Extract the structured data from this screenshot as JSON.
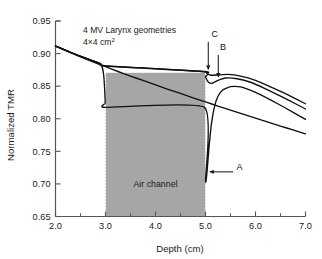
{
  "chart_data": {
    "type": "line",
    "title": "",
    "xlabel": "Depth (cm)",
    "ylabel": "Normalized TMR",
    "xlim": [
      2.0,
      7.0
    ],
    "ylim": [
      0.65,
      0.95
    ],
    "xticks": [
      "2.0",
      "3.0",
      "4.0",
      "5.0",
      "6.0",
      "7.0"
    ],
    "xtick_values": [
      2.0,
      3.0,
      4.0,
      5.0,
      6.0,
      7.0
    ],
    "xminor_values": [
      2.5,
      3.5,
      4.5,
      5.5,
      6.5
    ],
    "yticks": [
      "0.65",
      "0.70",
      "0.75",
      "0.80",
      "0.85",
      "0.90",
      "0.95"
    ],
    "ytick_values": [
      0.65,
      0.7,
      0.75,
      0.8,
      0.85,
      0.9,
      0.95
    ],
    "grid": false,
    "legend_position": "none",
    "annotations": [
      {
        "id": "title-line1",
        "text": "4 MV Larynx geometries",
        "x": 2.55,
        "y": 0.932
      },
      {
        "id": "title-line2",
        "text": "4×4 cm",
        "superscript": "2",
        "x": 2.55,
        "y": 0.913
      },
      {
        "id": "air-channel",
        "text": "Air channel",
        "x": 4.0,
        "y": 0.695
      },
      {
        "id": "curve-a",
        "text": "A",
        "x": 5.62,
        "y": 0.722
      },
      {
        "id": "curve-b",
        "text": "B",
        "x": 5.29,
        "y": 0.905
      },
      {
        "id": "curve-c",
        "text": "C",
        "x": 5.12,
        "y": 0.925
      }
    ],
    "shaded_region": {
      "label": "Air channel",
      "x_start": 3.0,
      "x_end": 5.0,
      "y_bottom": 0.65,
      "y_top": 0.8705,
      "color": "#a6a6a6",
      "edge_style": "dotted"
    },
    "series": [
      {
        "name": "Homogeneous reference",
        "description": "smooth attenuation curve, no air channel",
        "points": [
          [
            2.0,
            0.9115
          ],
          [
            2.25,
            0.903
          ],
          [
            2.5,
            0.895
          ],
          [
            2.75,
            0.8872
          ],
          [
            3.0,
            0.88
          ],
          [
            3.25,
            0.8725
          ],
          [
            3.5,
            0.8655
          ],
          [
            3.75,
            0.8588
          ],
          [
            4.0,
            0.852
          ],
          [
            4.25,
            0.8452
          ],
          [
            4.5,
            0.8388
          ],
          [
            4.75,
            0.8322
          ],
          [
            5.0,
            0.8258
          ],
          [
            5.25,
            0.8195
          ],
          [
            5.5,
            0.8132
          ],
          [
            5.75,
            0.807
          ],
          [
            6.0,
            0.8008
          ],
          [
            6.25,
            0.7948
          ],
          [
            6.5,
            0.7888
          ],
          [
            6.75,
            0.7828
          ],
          [
            7.0,
            0.7768
          ]
        ]
      },
      {
        "name": "A",
        "description": "deep rebuild-up curve, largest dose deficit at distal air interface",
        "points": [
          [
            2.0,
            0.9115
          ],
          [
            2.3,
            0.9018
          ],
          [
            2.6,
            0.893
          ],
          [
            2.85,
            0.8856
          ],
          [
            2.93,
            0.88
          ],
          [
            2.965,
            0.866
          ],
          [
            2.985,
            0.842
          ],
          [
            2.995,
            0.824
          ],
          [
            3.0,
            0.8175
          ],
          [
            4.98,
            0.8175
          ],
          [
            5.0,
            0.705
          ],
          [
            5.03,
            0.718
          ],
          [
            5.07,
            0.756
          ],
          [
            5.12,
            0.793
          ],
          [
            5.18,
            0.8185
          ],
          [
            5.25,
            0.8345
          ],
          [
            5.35,
            0.8445
          ],
          [
            5.5,
            0.8492
          ],
          [
            5.7,
            0.8488
          ],
          [
            6.0,
            0.8405
          ],
          [
            6.3,
            0.829
          ],
          [
            6.6,
            0.8165
          ],
          [
            7.0,
            0.799
          ]
        ]
      },
      {
        "name": "B",
        "description": "intermediate rebuild-up curve",
        "points": [
          [
            2.0,
            0.9115
          ],
          [
            2.3,
            0.9018
          ],
          [
            2.6,
            0.893
          ],
          [
            2.9,
            0.8845
          ],
          [
            3.0,
            0.881
          ],
          [
            4.97,
            0.872
          ],
          [
            5.0,
            0.864
          ],
          [
            5.06,
            0.856
          ],
          [
            5.13,
            0.8545
          ],
          [
            5.25,
            0.859
          ],
          [
            5.4,
            0.8625
          ],
          [
            5.6,
            0.8618
          ],
          [
            5.9,
            0.856
          ],
          [
            6.2,
            0.846
          ],
          [
            6.5,
            0.8348
          ],
          [
            6.8,
            0.823
          ],
          [
            7.0,
            0.815
          ]
        ]
      },
      {
        "name": "C",
        "description": "shallow rebuild-up curve, smallest perturbation",
        "points": [
          [
            2.0,
            0.9115
          ],
          [
            2.3,
            0.9018
          ],
          [
            2.6,
            0.893
          ],
          [
            2.9,
            0.8845
          ],
          [
            3.0,
            0.8812
          ],
          [
            4.98,
            0.8725
          ],
          [
            5.02,
            0.87
          ],
          [
            5.1,
            0.8668
          ],
          [
            5.25,
            0.8672
          ],
          [
            5.45,
            0.868
          ],
          [
            5.7,
            0.8655
          ],
          [
            6.0,
            0.859
          ],
          [
            6.3,
            0.849
          ],
          [
            6.6,
            0.8385
          ],
          [
            7.0,
            0.823
          ]
        ]
      }
    ]
  },
  "style": {
    "axis_color": "#555555",
    "curve_color": "#111111",
    "shade_color": "#a6a6a6",
    "background": "#ffffff"
  }
}
